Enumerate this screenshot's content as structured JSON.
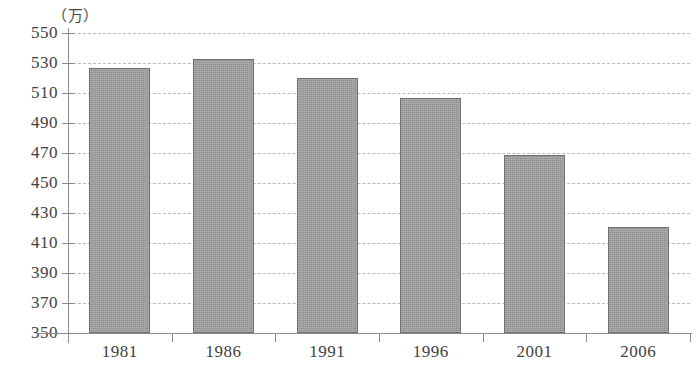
{
  "chart_data": {
    "type": "bar",
    "title": "",
    "xlabel": "",
    "ylabel": "",
    "unit_label": "（万）",
    "categories": [
      "1981",
      "1986",
      "1991",
      "1996",
      "2001",
      "2006"
    ],
    "values": [
      527,
      533,
      520,
      507,
      469,
      421
    ],
    "ylim": [
      350,
      550
    ],
    "ytick_step": 20,
    "yticks": [
      550,
      530,
      510,
      490,
      470,
      450,
      430,
      410,
      390,
      370,
      350
    ],
    "ytick_labels": [
      "550",
      "530",
      "510",
      "490",
      "470",
      "450",
      "430",
      "410",
      "390",
      "370",
      "350"
    ],
    "grid": true,
    "grid_style": "dashed",
    "legend": false,
    "series": [
      {
        "name": "",
        "values": [
          527,
          533,
          520,
          507,
          469,
          421
        ]
      }
    ],
    "colors": {
      "bar_fill": "#9c9c9c",
      "bar_border": "#6f6f6f",
      "gridline": "#b9b9b9",
      "axis": "#8c8c8c",
      "text": "#3f3f3f"
    }
  }
}
